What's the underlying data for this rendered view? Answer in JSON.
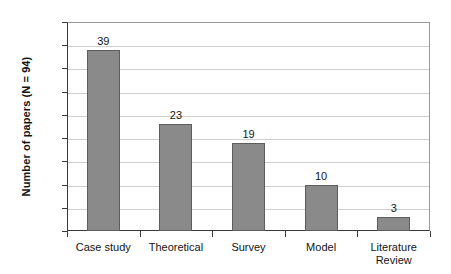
{
  "chart_data": {
    "type": "bar",
    "title": "",
    "xlabel": "",
    "ylabel": "Number of papers (N = 94)",
    "categories": [
      "Case study",
      "Theoretical",
      "Survey",
      "Model",
      "Literature Review"
    ],
    "category_lines": [
      [
        "Case study"
      ],
      [
        "Theoretical"
      ],
      [
        "Survey"
      ],
      [
        "Model"
      ],
      [
        "Literature",
        "Review"
      ]
    ],
    "values": [
      39,
      23,
      19,
      10,
      3
    ],
    "value_labels": [
      "39",
      "23",
      "19",
      "10",
      "3"
    ],
    "ylim": [
      0,
      45
    ],
    "ytick_step": 5,
    "yticks": [
      45,
      40,
      35,
      30,
      25,
      20,
      15,
      10,
      5,
      0
    ],
    "ytick_labels": [
      "45",
      "40",
      "35",
      "30",
      "25",
      "20",
      "15",
      "10",
      "5",
      "0"
    ],
    "grid": true,
    "legend": false,
    "legend_position": "none",
    "total_n": 94
  },
  "style": {
    "bar_fill": "#8a8a8a",
    "bar_border": "#5d5d5d",
    "gridline_color": "#cfcfcf",
    "axis_color": "#3a3a3a",
    "text_color": "#141414",
    "background": "#ffffff"
  }
}
